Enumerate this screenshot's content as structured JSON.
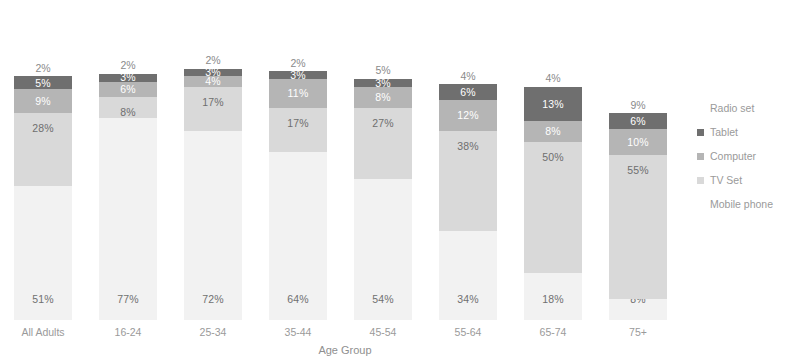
{
  "chart_data": {
    "type": "bar",
    "subtype": "stacked-bar-100",
    "title": "",
    "xlabel": "Age Group",
    "ylabel": "",
    "ylim": [
      0,
      100
    ],
    "grid": false,
    "legend_position": "right",
    "categories": [
      "All Adults",
      "16-24",
      "25-34",
      "35-44",
      "45-54",
      "55-64",
      "65-74",
      "75+"
    ],
    "series": [
      {
        "name": "Mobile phone",
        "color": "#f2f2f2",
        "values": [
          51,
          77,
          72,
          64,
          54,
          34,
          18,
          8
        ],
        "labels": [
          "51%",
          "77%",
          "72%",
          "64%",
          "54%",
          "34%",
          "18%",
          "8%"
        ]
      },
      {
        "name": "TV Set",
        "color": "#d9d9d9",
        "values": [
          28,
          8,
          17,
          17,
          27,
          38,
          50,
          55
        ],
        "labels": [
          "28%",
          "8%",
          "17%",
          "17%",
          "27%",
          "38%",
          "50%",
          "55%"
        ]
      },
      {
        "name": "Computer",
        "color": "#b5b5b5",
        "values": [
          9,
          6,
          4,
          11,
          8,
          12,
          8,
          10
        ],
        "labels": [
          "9%",
          "6%",
          "4%",
          "11%",
          "8%",
          "12%",
          "8%",
          "10%"
        ]
      },
      {
        "name": "Tablet",
        "color": "#6f6f6f",
        "values": [
          5,
          3,
          3,
          3,
          3,
          6,
          13,
          6
        ],
        "labels": [
          "5%",
          "3%",
          "3%",
          "3%",
          "3%",
          "6%",
          "13%",
          "6%"
        ]
      },
      {
        "name": "Radio set",
        "color": "#ffffff",
        "values": [
          2,
          2,
          2,
          2,
          5,
          4,
          4,
          9
        ],
        "labels": [
          "2%",
          "2%",
          "2%",
          "2%",
          "5%",
          "4%",
          "4%",
          "9%"
        ]
      }
    ]
  },
  "legend": {
    "items": [
      {
        "label": "Radio set",
        "swatch": "blank"
      },
      {
        "label": "Tablet",
        "swatch": "tablet"
      },
      {
        "label": "Computer",
        "swatch": "computer"
      },
      {
        "label": "TV Set",
        "swatch": "tvset"
      },
      {
        "label": "Mobile phone",
        "swatch": "blank"
      }
    ]
  }
}
